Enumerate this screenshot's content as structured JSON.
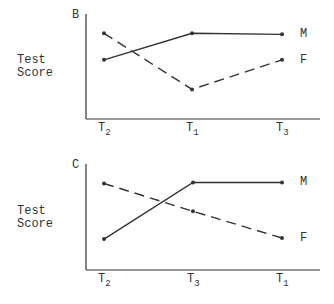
{
  "chart_data": [
    {
      "type": "line",
      "panel_label": "B",
      "title": "",
      "xlabel": "",
      "ylabel": "Test Score",
      "ylabel_lines": [
        "Test",
        "Score"
      ],
      "categories": [
        "T2",
        "T1",
        "T3"
      ],
      "x_ticks": [
        {
          "base": "T",
          "sub": "2"
        },
        {
          "base": "T",
          "sub": "1"
        },
        {
          "base": "T",
          "sub": "3"
        }
      ],
      "ylim": [
        0,
        100
      ],
      "grid": false,
      "legend_position": "right-inline",
      "series": [
        {
          "name": "M",
          "style": "solid",
          "values": [
            58,
            84,
            83
          ]
        },
        {
          "name": "F",
          "style": "dashed",
          "values": [
            84,
            29,
            58
          ]
        }
      ]
    },
    {
      "type": "line",
      "panel_label": "C",
      "title": "",
      "xlabel": "",
      "ylabel": "Test Score",
      "ylabel_lines": [
        "Test",
        "Score"
      ],
      "categories": [
        "T2",
        "T3",
        "T1"
      ],
      "x_ticks": [
        {
          "base": "T",
          "sub": "2"
        },
        {
          "base": "T",
          "sub": "3"
        },
        {
          "base": "T",
          "sub": "1"
        }
      ],
      "ylim": [
        0,
        100
      ],
      "grid": false,
      "legend_position": "right-inline",
      "series": [
        {
          "name": "M",
          "style": "solid",
          "values": [
            30,
            85,
            85
          ]
        },
        {
          "name": "F",
          "style": "dashed",
          "values": [
            84,
            57,
            31
          ]
        }
      ]
    }
  ],
  "colors": {
    "ink": "#333333",
    "background": "#ffffff"
  }
}
